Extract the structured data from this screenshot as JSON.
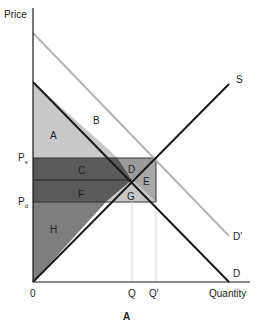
{
  "title": "A",
  "axes": {
    "y_label": "Price",
    "x_label": "Quantity",
    "origin_label": "0"
  },
  "price_labels": {
    "ps": {
      "main": "P",
      "sub": "s"
    },
    "pd": {
      "main": "P",
      "sub": "d"
    }
  },
  "quantity_labels": {
    "q": "Q",
    "q_prime": "Q′"
  },
  "curves": {
    "supply": "S",
    "demand": "D",
    "demand_shifted": "D′"
  },
  "regions": {
    "a": "A",
    "b": "B",
    "c": "C",
    "d": "D",
    "e": "E",
    "f": "F",
    "g": "G",
    "h": "H"
  },
  "colors": {
    "axis": "#1a1a1a",
    "supply": "#1a1a1a",
    "demand": "#1a1a1a",
    "demand_shifted": "#b4b4b4",
    "region_light": "#c8c8c8",
    "region_mid": "#9a9a9a",
    "region_dark": "#5a5a5a",
    "region_h": "#7e7e7e"
  }
}
